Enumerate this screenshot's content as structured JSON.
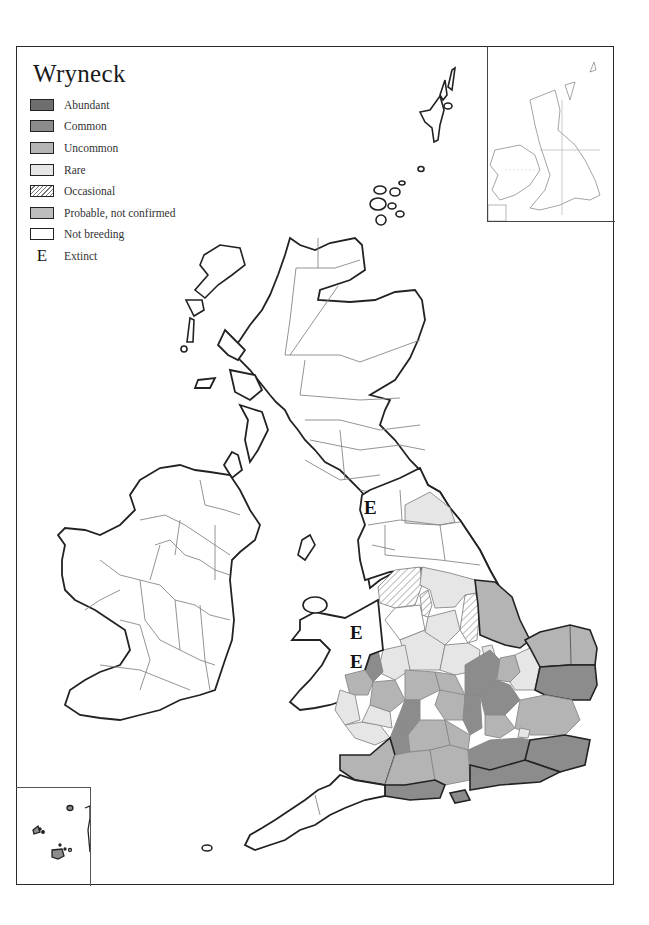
{
  "title": "Wryneck",
  "legend": {
    "items": [
      {
        "label": "Abundant",
        "color": "#6e6e6e"
      },
      {
        "label": "Common",
        "color": "#8c8c8c"
      },
      {
        "label": "Uncommon",
        "color": "#b4b4b4"
      },
      {
        "label": "Rare",
        "color": "#e6e6e6"
      },
      {
        "label": "Occasional",
        "pattern": "hatched"
      },
      {
        "label": "Probable, not confirmed",
        "color": "#bdbdbd"
      },
      {
        "label": "Not breeding",
        "color": "#ffffff"
      },
      {
        "label": "Extinct",
        "symbol": "E"
      }
    ]
  },
  "markers": {
    "extinct_symbol": "E",
    "extinct_locations": [
      "Cumbria",
      "North Wales",
      "Mid Wales"
    ]
  },
  "insets": {
    "top_right": "Overview map of British Isles with grid",
    "bottom_left": "Channel Islands"
  }
}
